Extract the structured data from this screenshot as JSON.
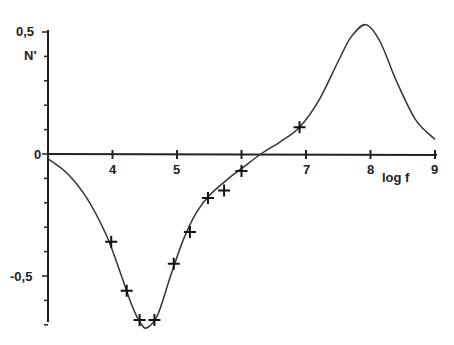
{
  "chart_data": {
    "type": "line",
    "title": "",
    "xlabel": "log f",
    "ylabel": "N'",
    "xlim": [
      3,
      9
    ],
    "ylim": [
      -0.72,
      0.5
    ],
    "x_ticks": [
      3,
      4,
      5,
      6,
      7,
      8,
      9
    ],
    "x_tick_labels": [
      "",
      "4",
      "5",
      "",
      "7",
      "8",
      "9"
    ],
    "y_tick_labels": [
      "0,5",
      "0",
      "-0,5"
    ],
    "grid": false,
    "series": [
      {
        "name": "fitted curve",
        "style": "line",
        "x": [
          3.0,
          3.3,
          3.6,
          3.9,
          4.1,
          4.3,
          4.45,
          4.55,
          4.7,
          4.9,
          5.1,
          5.3,
          5.5,
          5.8,
          6.0,
          6.3,
          6.6,
          6.9,
          7.2,
          7.5,
          7.7,
          7.93,
          8.15,
          8.4,
          8.7,
          9.0
        ],
        "values": [
          -0.02,
          -0.08,
          -0.18,
          -0.33,
          -0.47,
          -0.62,
          -0.7,
          -0.71,
          -0.66,
          -0.5,
          -0.35,
          -0.24,
          -0.17,
          -0.1,
          -0.06,
          0.0,
          0.05,
          0.11,
          0.22,
          0.38,
          0.48,
          0.53,
          0.46,
          0.3,
          0.14,
          0.06
        ]
      },
      {
        "name": "measured points",
        "style": "markers",
        "marker": "+",
        "x": [
          3.98,
          4.22,
          4.42,
          4.65,
          4.95,
          5.2,
          5.48,
          5.73,
          6.0,
          6.9
        ],
        "values": [
          -0.36,
          -0.56,
          -0.68,
          -0.68,
          -0.45,
          -0.32,
          -0.18,
          -0.15,
          -0.07,
          0.11
        ]
      }
    ]
  },
  "labels": {
    "y_top": "0,5",
    "y_name": "N'",
    "y_zero": "0",
    "y_neg": "-0,5",
    "x4": "4",
    "x5": "5",
    "x7": "7",
    "x8": "8",
    "x9": "9",
    "x_name": "log f"
  }
}
